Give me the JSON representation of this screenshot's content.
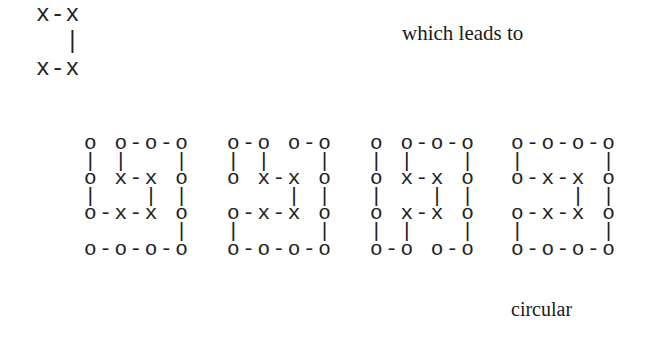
{
  "top_diagram": {
    "lines": [
      "x-x",
      "  |",
      "x-x"
    ]
  },
  "lead_text": "which leads to",
  "grids": [
    {
      "lines": [
        "o o-o-o",
        "| |   |",
        "o x-x o",
        "|   | |",
        "o-x-x o",
        "      |",
        "o-o-o-o"
      ],
      "label": ""
    },
    {
      "lines": [
        "o-o o-o",
        "| |   |",
        "o x-x o",
        "    | |",
        "o-x-x o",
        "|     |",
        "o-o-o-o"
      ],
      "label": ""
    },
    {
      "lines": [
        "o o-o-o",
        "| |   |",
        "o x-x o",
        "|   | |",
        "o x-x o",
        "| |   |",
        "o-o o-o"
      ],
      "label": ""
    },
    {
      "lines": [
        "o-o-o-o",
        "|     |",
        "o-x-x o",
        "    | |",
        "o-x-x o",
        "|     |",
        "o-o-o-o"
      ],
      "label": "circular"
    }
  ]
}
